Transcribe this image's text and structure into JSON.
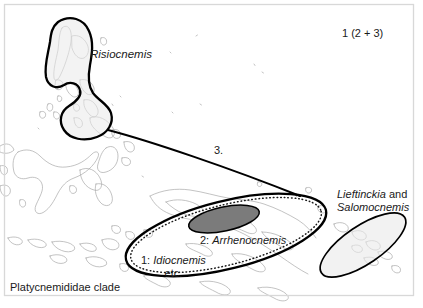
{
  "figure": {
    "title_internal": "Platycnemididae clade biogeography",
    "frame_color": "#d6d6d6",
    "background_color": "#ffffff",
    "coastline_color": "#a8a8a8"
  },
  "labels": {
    "risiocnemis": "Risiocnemis",
    "clade_code": "1 (2 + 3)",
    "link_3": "3.",
    "lieftinckia_genus": "Lieftinckia",
    "lieftinckia_conj": " and",
    "salomocnemis_genus": "Salomocnemis",
    "arrhenocnemis_num": "2: ",
    "arrhenocnemis_genus": "Arrhenocnemis",
    "idiocnemis_num": "1: ",
    "idiocnemis_genus": "Idiocnemis",
    "idiocnemis_etc": "etc.",
    "platycnemididae": "Platycnemididae clade"
  },
  "regions": [
    {
      "name": "risiocnemis-range",
      "label": "Risiocnemis",
      "shape": "hooked-blob",
      "fill": "#e8e8e8",
      "stroke": "#000000",
      "stroke_width": 2.2,
      "area": "Philippines"
    },
    {
      "name": "new-guinea-range",
      "label": "1: Idiocnemis etc.",
      "shape": "ellipse-with-dotted-inner",
      "fill": "#ffffff",
      "stroke": "#000000",
      "stroke_width": 2.2,
      "inner_style": "dotted",
      "area": "New Guinea"
    },
    {
      "name": "arrhenocnemis-range",
      "label": "2: Arrhenocnemis",
      "shape": "ellipse",
      "fill": "#777777",
      "stroke": "#000000",
      "stroke_width": 1.4,
      "area": "central New Guinea highlands"
    },
    {
      "name": "solomons-range",
      "label": "Lieftinckia and Salomocnemis",
      "shape": "ellipse",
      "fill": "#e8e8e8",
      "stroke": "#000000",
      "stroke_width": 1.6,
      "area": "Solomon Islands"
    }
  ],
  "connector": {
    "name": "link-3-connector",
    "label": "3.",
    "from": "risiocnemis-range",
    "to": "solomons-range",
    "stroke": "#000000",
    "stroke_width": 2.2
  }
}
